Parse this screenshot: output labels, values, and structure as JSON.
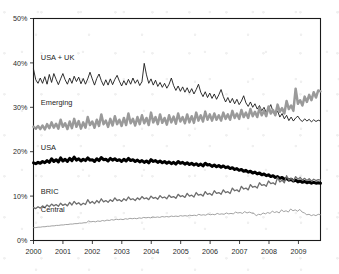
{
  "chart_data": {
    "type": "line",
    "title": "",
    "subtitle": "",
    "xlabel": "",
    "ylabel": "",
    "xlim": [
      2000,
      2009.75
    ],
    "ylim": [
      0,
      50
    ],
    "ytick_labels": [
      "0%",
      "10%",
      "20%",
      "30%",
      "40%",
      "50%"
    ],
    "ytick_values": [
      0,
      10,
      20,
      30,
      40,
      50
    ],
    "xtick_labels": [
      "2000",
      "2001",
      "2002",
      "2003",
      "2004",
      "2005",
      "2006",
      "2007",
      "2008",
      "2009"
    ],
    "xtick_values": [
      2000,
      2001,
      2002,
      2003,
      2004,
      2005,
      2006,
      2007,
      2008,
      2009
    ],
    "grid": false,
    "legend_position": "inline-left-labels",
    "y_unit": "percent",
    "series": [
      {
        "name": "USA + UK",
        "label": "USA + UK",
        "color": "#1a1a1a",
        "width": 0.9,
        "label_x": 2000.25,
        "label_y": 40.6,
        "values": [
          38.6,
          36.2,
          35.4,
          36.6,
          35.4,
          36.9,
          35.2,
          37.4,
          35.6,
          37.6,
          36.3,
          35.1,
          36.4,
          37.6,
          36.2,
          35.2,
          36.6,
          35.4,
          37.0,
          35.8,
          36.8,
          35.3,
          36.5,
          35.2,
          36.4,
          37.9,
          36.4,
          35.0,
          36.5,
          37.5,
          36.0,
          34.9,
          36.2,
          35.0,
          36.4,
          35.1,
          36.3,
          37.2,
          35.9,
          34.8,
          36.0,
          35.0,
          36.3,
          35.2,
          36.6,
          35.4,
          36.2,
          34.9,
          35.8,
          39.9,
          37.3,
          35.4,
          36.4,
          35.0,
          36.1,
          34.7,
          35.6,
          34.5,
          35.4,
          34.3,
          35.2,
          36.6,
          34.9,
          33.8,
          34.8,
          33.6,
          34.6,
          33.4,
          34.4,
          33.2,
          34.2,
          33.0,
          34.0,
          35.2,
          33.4,
          32.4,
          33.5,
          32.2,
          33.2,
          32.0,
          33.0,
          31.8,
          32.8,
          34.0,
          32.4,
          31.2,
          32.2,
          31.0,
          32.0,
          30.8,
          31.8,
          30.6,
          31.4,
          32.6,
          31.0,
          30.2,
          31.2,
          30.0,
          30.8,
          29.6,
          30.4,
          29.2,
          30.0,
          28.8,
          29.6,
          30.6,
          29.0,
          28.2,
          29.2,
          27.8,
          28.6,
          27.4,
          28.2,
          27.0,
          27.8,
          26.9,
          27.6,
          28.0,
          27.2,
          26.8,
          27.4,
          26.9,
          27.3,
          26.7,
          27.2,
          26.8,
          27.1,
          26.9
        ]
      },
      {
        "name": "Emerging",
        "label": "Emerging",
        "color": "#9a9a9a",
        "width": 2.5,
        "label_x": 2000.25,
        "label_y": 30.5,
        "values": [
          25.6,
          25.2,
          25.8,
          25.1,
          25.9,
          25.0,
          26.2,
          25.3,
          26.6,
          25.4,
          26.3,
          25.2,
          27.2,
          25.6,
          26.4,
          25.1,
          26.8,
          25.3,
          27.4,
          25.6,
          26.9,
          25.2,
          26.6,
          25.4,
          27.8,
          26.0,
          26.8,
          25.4,
          27.2,
          25.8,
          28.4,
          26.2,
          27.0,
          25.6,
          27.4,
          25.9,
          28.0,
          26.2,
          27.2,
          25.8,
          27.6,
          26.0,
          28.6,
          26.4,
          27.4,
          25.9,
          27.8,
          26.2,
          28.2,
          26.4,
          27.6,
          26.0,
          28.8,
          26.6,
          27.8,
          26.2,
          28.4,
          26.5,
          27.6,
          26.1,
          28.2,
          26.6,
          27.9,
          26.3,
          28.6,
          26.8,
          27.8,
          26.4,
          28.4,
          26.6,
          28.0,
          26.5,
          28.8,
          27.0,
          28.2,
          26.8,
          29.0,
          27.2,
          28.4,
          27.0,
          28.6,
          27.2,
          28.2,
          27.0,
          28.8,
          27.4,
          28.4,
          27.2,
          29.2,
          27.6,
          28.6,
          27.4,
          29.4,
          27.8,
          28.8,
          27.6,
          29.6,
          28.0,
          29.0,
          27.8,
          29.8,
          28.2,
          29.2,
          28.0,
          30.2,
          28.6,
          29.4,
          28.2,
          30.6,
          29.0,
          29.8,
          28.6,
          31.4,
          29.6,
          30.4,
          29.2,
          34.2,
          30.8,
          31.6,
          30.4,
          32.4,
          31.2,
          32.8,
          31.6,
          33.4,
          32.2,
          33.8,
          33.6
        ]
      },
      {
        "name": "USA",
        "label": "USA",
        "color": "#000000",
        "width": 3.0,
        "label_x": 2000.25,
        "label_y": 20.4,
        "values": [
          17.5,
          17.3,
          17.6,
          17.4,
          17.8,
          17.5,
          18.0,
          17.6,
          18.4,
          17.8,
          18.2,
          17.7,
          18.6,
          17.9,
          18.3,
          17.8,
          18.5,
          18.0,
          18.8,
          18.1,
          18.4,
          17.9,
          18.3,
          18.0,
          18.6,
          18.1,
          18.2,
          17.8,
          18.4,
          18.0,
          18.7,
          18.2,
          18.3,
          17.9,
          18.5,
          18.1,
          18.4,
          18.0,
          18.2,
          17.8,
          18.3,
          17.9,
          18.5,
          18.0,
          18.2,
          17.8,
          18.1,
          17.7,
          18.0,
          17.6,
          17.9,
          17.5,
          18.2,
          17.8,
          18.0,
          17.6,
          17.9,
          17.5,
          17.8,
          17.4,
          17.7,
          17.3,
          17.6,
          17.2,
          17.8,
          17.4,
          17.6,
          17.2,
          17.5,
          17.1,
          17.4,
          17.0,
          17.3,
          16.9,
          17.2,
          16.8,
          17.4,
          17.0,
          17.1,
          16.7,
          17.0,
          16.6,
          16.9,
          16.5,
          16.8,
          16.4,
          16.6,
          16.2,
          16.4,
          16.0,
          16.2,
          15.8,
          16.0,
          15.6,
          15.8,
          15.4,
          15.6,
          15.2,
          15.4,
          15.0,
          15.2,
          14.8,
          15.0,
          14.6,
          14.8,
          14.4,
          14.6,
          14.2,
          14.4,
          14.0,
          14.2,
          13.8,
          14.0,
          13.6,
          13.8,
          13.4,
          13.6,
          13.2,
          13.4,
          13.1,
          13.3,
          13.0,
          13.2,
          12.9,
          13.1,
          12.9,
          13.0,
          12.9
        ]
      },
      {
        "name": "BRIC",
        "label": "BRIC",
        "color": "#6e6e6e",
        "width": 1.3,
        "label_x": 2000.25,
        "label_y": 10.4,
        "values": [
          7.4,
          7.2,
          7.6,
          7.3,
          7.8,
          7.4,
          8.0,
          7.6,
          8.2,
          7.8,
          8.1,
          7.7,
          8.4,
          7.9,
          8.2,
          7.8,
          8.6,
          8.0,
          8.8,
          8.2,
          8.5,
          8.0,
          8.4,
          8.1,
          9.2,
          8.4,
          8.8,
          8.3,
          9.0,
          8.5,
          9.4,
          8.7,
          9.0,
          8.6,
          9.2,
          8.8,
          9.6,
          9.0,
          9.2,
          8.8,
          9.4,
          9.0,
          9.8,
          9.2,
          9.4,
          9.0,
          9.6,
          9.2,
          9.9,
          9.4,
          9.6,
          9.2,
          10.0,
          9.5,
          9.7,
          9.3,
          10.1,
          9.6,
          9.8,
          9.4,
          10.2,
          9.7,
          9.9,
          9.5,
          10.4,
          9.9,
          10.1,
          9.7,
          10.6,
          10.0,
          10.2,
          9.8,
          10.8,
          10.2,
          10.4,
          10.0,
          11.0,
          10.4,
          10.6,
          10.2,
          11.2,
          10.6,
          10.8,
          10.4,
          11.4,
          10.8,
          11.0,
          10.6,
          11.8,
          11.2,
          11.4,
          11.0,
          12.2,
          11.6,
          11.8,
          11.4,
          12.6,
          12.0,
          12.2,
          11.8,
          13.0,
          12.4,
          12.6,
          12.2,
          13.4,
          12.8,
          13.0,
          12.6,
          14.2,
          13.2,
          13.6,
          13.0,
          14.6,
          13.6,
          14.0,
          13.4,
          14.4,
          13.8,
          14.2,
          13.6,
          14.0,
          13.5,
          13.9,
          13.4,
          13.8,
          13.5,
          13.7,
          13.6
        ]
      },
      {
        "name": "Central",
        "label": "Central",
        "color": "#8c8c8c",
        "width": 0.8,
        "label_x": 2000.25,
        "label_y": 6.4,
        "values": [
          2.9,
          2.9,
          3.0,
          3.0,
          3.1,
          3.1,
          3.2,
          3.2,
          3.3,
          3.3,
          3.4,
          3.4,
          3.5,
          3.5,
          3.6,
          3.6,
          3.7,
          3.7,
          3.8,
          3.8,
          3.9,
          3.9,
          4.0,
          4.0,
          4.4,
          4.2,
          4.3,
          4.2,
          4.4,
          4.3,
          4.5,
          4.4,
          4.6,
          4.5,
          4.7,
          4.6,
          4.8,
          4.7,
          4.8,
          4.7,
          4.9,
          4.8,
          5.0,
          4.9,
          5.0,
          4.9,
          5.1,
          5.0,
          5.2,
          5.1,
          5.2,
          5.1,
          5.3,
          5.2,
          5.3,
          5.2,
          5.4,
          5.3,
          5.4,
          5.3,
          5.5,
          5.4,
          5.5,
          5.4,
          5.6,
          5.5,
          5.6,
          5.5,
          5.7,
          5.6,
          5.7,
          5.6,
          5.9,
          5.7,
          5.8,
          5.7,
          6.0,
          5.8,
          5.9,
          5.8,
          6.1,
          5.9,
          6.0,
          5.9,
          6.2,
          6.0,
          6.1,
          6.0,
          6.4,
          6.2,
          6.3,
          6.1,
          6.5,
          6.2,
          6.4,
          6.2,
          6.1,
          5.6,
          5.9,
          5.8,
          6.2,
          6.0,
          6.3,
          6.1,
          6.6,
          6.3,
          6.5,
          6.2,
          6.9,
          6.5,
          6.7,
          6.4,
          7.1,
          6.7,
          6.9,
          6.6,
          7.0,
          6.4,
          6.2,
          5.8,
          5.9,
          5.6,
          5.8,
          5.6,
          5.9,
          5.8
        ]
      }
    ]
  }
}
